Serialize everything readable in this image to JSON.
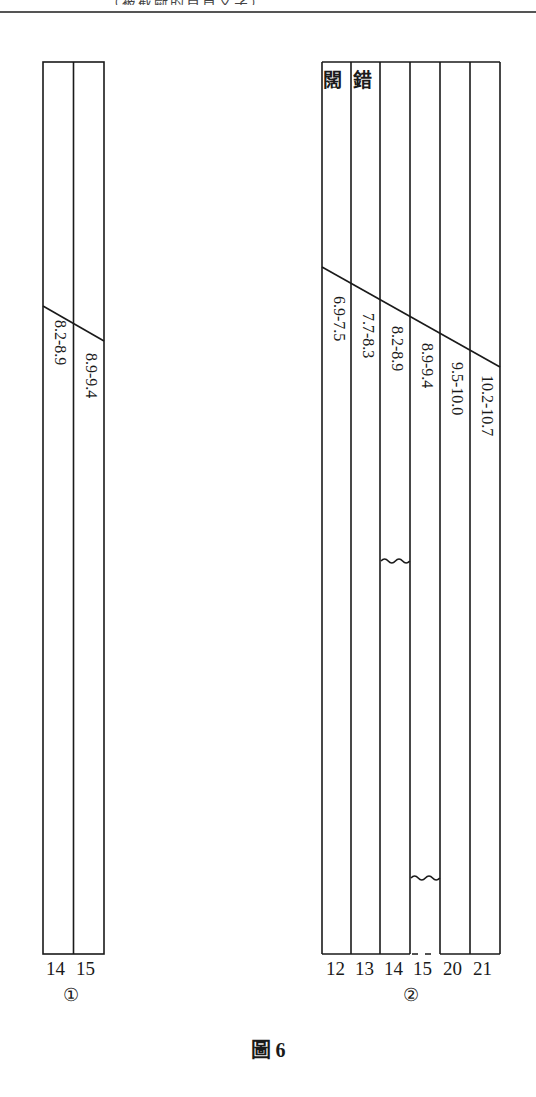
{
  "header": {
    "text": "…（被截斷的頁首文字）…"
  },
  "figure": {
    "caption": "圖 6",
    "panels": [
      {
        "id": "panel-1",
        "marker": "①",
        "columns": [
          {
            "number": "14",
            "range": "8.2-8.9"
          },
          {
            "number": "15",
            "range": "8.9-9.4"
          }
        ]
      },
      {
        "id": "panel-2",
        "marker": "②",
        "top_labels": [
          "闊",
          "錯"
        ],
        "columns": [
          {
            "number": "12",
            "range": "6.9-7.5"
          },
          {
            "number": "13",
            "range": "7.7-8.3"
          },
          {
            "number": "14",
            "range": "8.2-8.9",
            "break": "wavy"
          },
          {
            "number": "15",
            "range": "8.9-9.4",
            "break": "wavy",
            "bottom": "dashed"
          },
          {
            "number": "20",
            "range": "9.5-10.0"
          },
          {
            "number": "21",
            "range": "10.2-10.7"
          }
        ]
      }
    ]
  },
  "colors": {
    "line": "#1a1a1a",
    "background": "#ffffff"
  }
}
